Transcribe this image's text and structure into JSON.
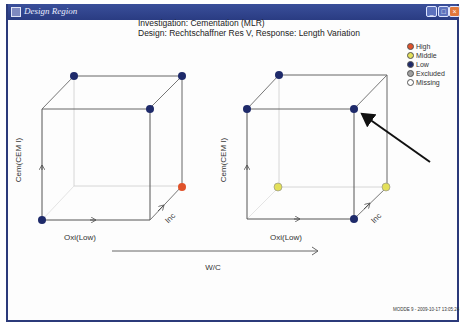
{
  "window": {
    "title": "Design Region",
    "buttons": {
      "minimize": "_",
      "maximize": "□",
      "close": "×"
    }
  },
  "header": {
    "line1": "Investigation: Cementation (MLR)",
    "line2": "Design: Rechtschaffner Res V, Response: Length Variation"
  },
  "legend": {
    "items": [
      {
        "label": "High",
        "color": "#e0522a"
      },
      {
        "label": "Middle",
        "color": "#e3e05a"
      },
      {
        "label": "Low",
        "color": "#1e2a6a"
      },
      {
        "label": "Excluded",
        "color": "#a0a0a0"
      },
      {
        "label": "Missing",
        "color": "#ffffff"
      }
    ]
  },
  "axes": {
    "y_label": "Cem(CEM I)",
    "x_label": "Oxi(Low)",
    "z_label": "Inc",
    "w_label": "W/C"
  },
  "cubes": [
    {
      "name": "left",
      "points": [
        {
          "corner": "back-top-left",
          "level": "Low"
        },
        {
          "corner": "back-top-right",
          "level": "Low"
        },
        {
          "corner": "front-top-right",
          "level": "Low"
        },
        {
          "corner": "front-bottom-left",
          "level": "Low"
        },
        {
          "corner": "back-bottom-right",
          "level": "High"
        }
      ]
    },
    {
      "name": "right",
      "points": [
        {
          "corner": "back-top-left",
          "level": "Low"
        },
        {
          "corner": "front-top-left",
          "level": "Low"
        },
        {
          "corner": "front-top-right",
          "level": "Low"
        },
        {
          "corner": "front-bottom-right",
          "level": "Low"
        },
        {
          "corner": "back-bottom-left",
          "level": "Middle"
        },
        {
          "corner": "back-bottom-right",
          "level": "Middle"
        }
      ]
    }
  ],
  "footer": "MODDE 9 - 2009-10-17 13:05:24"
}
